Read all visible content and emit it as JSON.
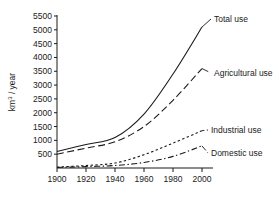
{
  "chart_data": {
    "type": "line",
    "title": "",
    "xlabel": "",
    "ylabel": "km3 / year",
    "ylabel_display": "km³ / year",
    "x": [
      1900,
      1920,
      1940,
      1960,
      1980,
      2000
    ],
    "xlim": [
      1900,
      2000
    ],
    "ylim": [
      0,
      5500
    ],
    "xticks": [
      "1900",
      "1920",
      "1940",
      "1960",
      "1980",
      "2000"
    ],
    "yticks": [
      "500",
      "1000",
      "1500",
      "2000",
      "2500",
      "3000",
      "3500",
      "4000",
      "4500",
      "5000",
      "5500"
    ],
    "ytick_values": [
      500,
      1000,
      1500,
      2000,
      2500,
      3000,
      3500,
      4000,
      4500,
      5000,
      5500
    ],
    "grid": false,
    "legend_position": "inline-right-labels",
    "series": [
      {
        "name": "Total use",
        "label": "Total use",
        "style": "solid",
        "values": [
          600,
          850,
          1100,
          1950,
          3400,
          5100
        ]
      },
      {
        "name": "Agricultural use",
        "label": "Agricultural use",
        "style": "long-dash",
        "values": [
          500,
          720,
          950,
          1500,
          2450,
          3600
        ]
      },
      {
        "name": "Industrial use",
        "label": "Industrial use",
        "style": "short-dash",
        "values": [
          30,
          90,
          180,
          480,
          900,
          1350
        ]
      },
      {
        "name": "Domestic use",
        "label": "Domestic use",
        "style": "dash-dot",
        "values": [
          20,
          50,
          90,
          200,
          420,
          800
        ]
      }
    ],
    "colors": {
      "axis": "#1a1a1a",
      "line": "#1a1a1a",
      "background": "#ffffff"
    }
  }
}
